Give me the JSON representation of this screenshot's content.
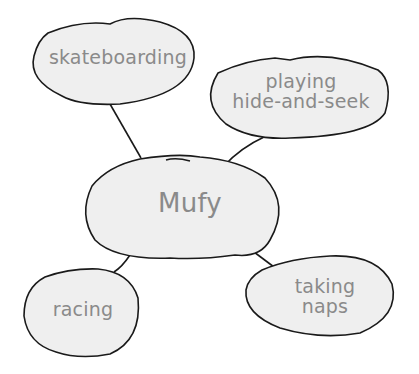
{
  "diagram": {
    "type": "web-organizer",
    "colors": {
      "bubble_fill": "#efefef",
      "stroke": "#1a1a1a",
      "text": "#8a8a8a"
    },
    "center": {
      "label": "Mufy"
    },
    "nodes": [
      {
        "id": "skateboarding",
        "label": "skateboarding"
      },
      {
        "id": "hide-and-seek",
        "line1": "playing",
        "line2": "hide-and-seek"
      },
      {
        "id": "racing",
        "label": "racing"
      },
      {
        "id": "naps",
        "line1": "taking",
        "line2": "naps"
      }
    ]
  }
}
